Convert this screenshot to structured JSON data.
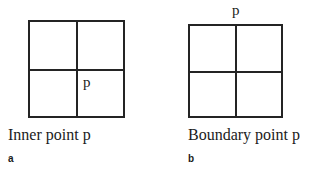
{
  "figure": {
    "panels": [
      {
        "id": "a",
        "sub_label": "a",
        "caption": "Inner point p",
        "point_label": "p",
        "point_position": "lower-right-quadrant-inside",
        "grid": {
          "rows": 2,
          "cols": 2
        }
      },
      {
        "id": "b",
        "sub_label": "b",
        "caption": "Boundary point p",
        "point_label": "p",
        "point_position": "above-top-edge-center",
        "grid": {
          "rows": 2,
          "cols": 2
        }
      }
    ],
    "colors": {
      "line": "#242424",
      "text": "#1b1b1b",
      "background": "#ffffff"
    }
  }
}
